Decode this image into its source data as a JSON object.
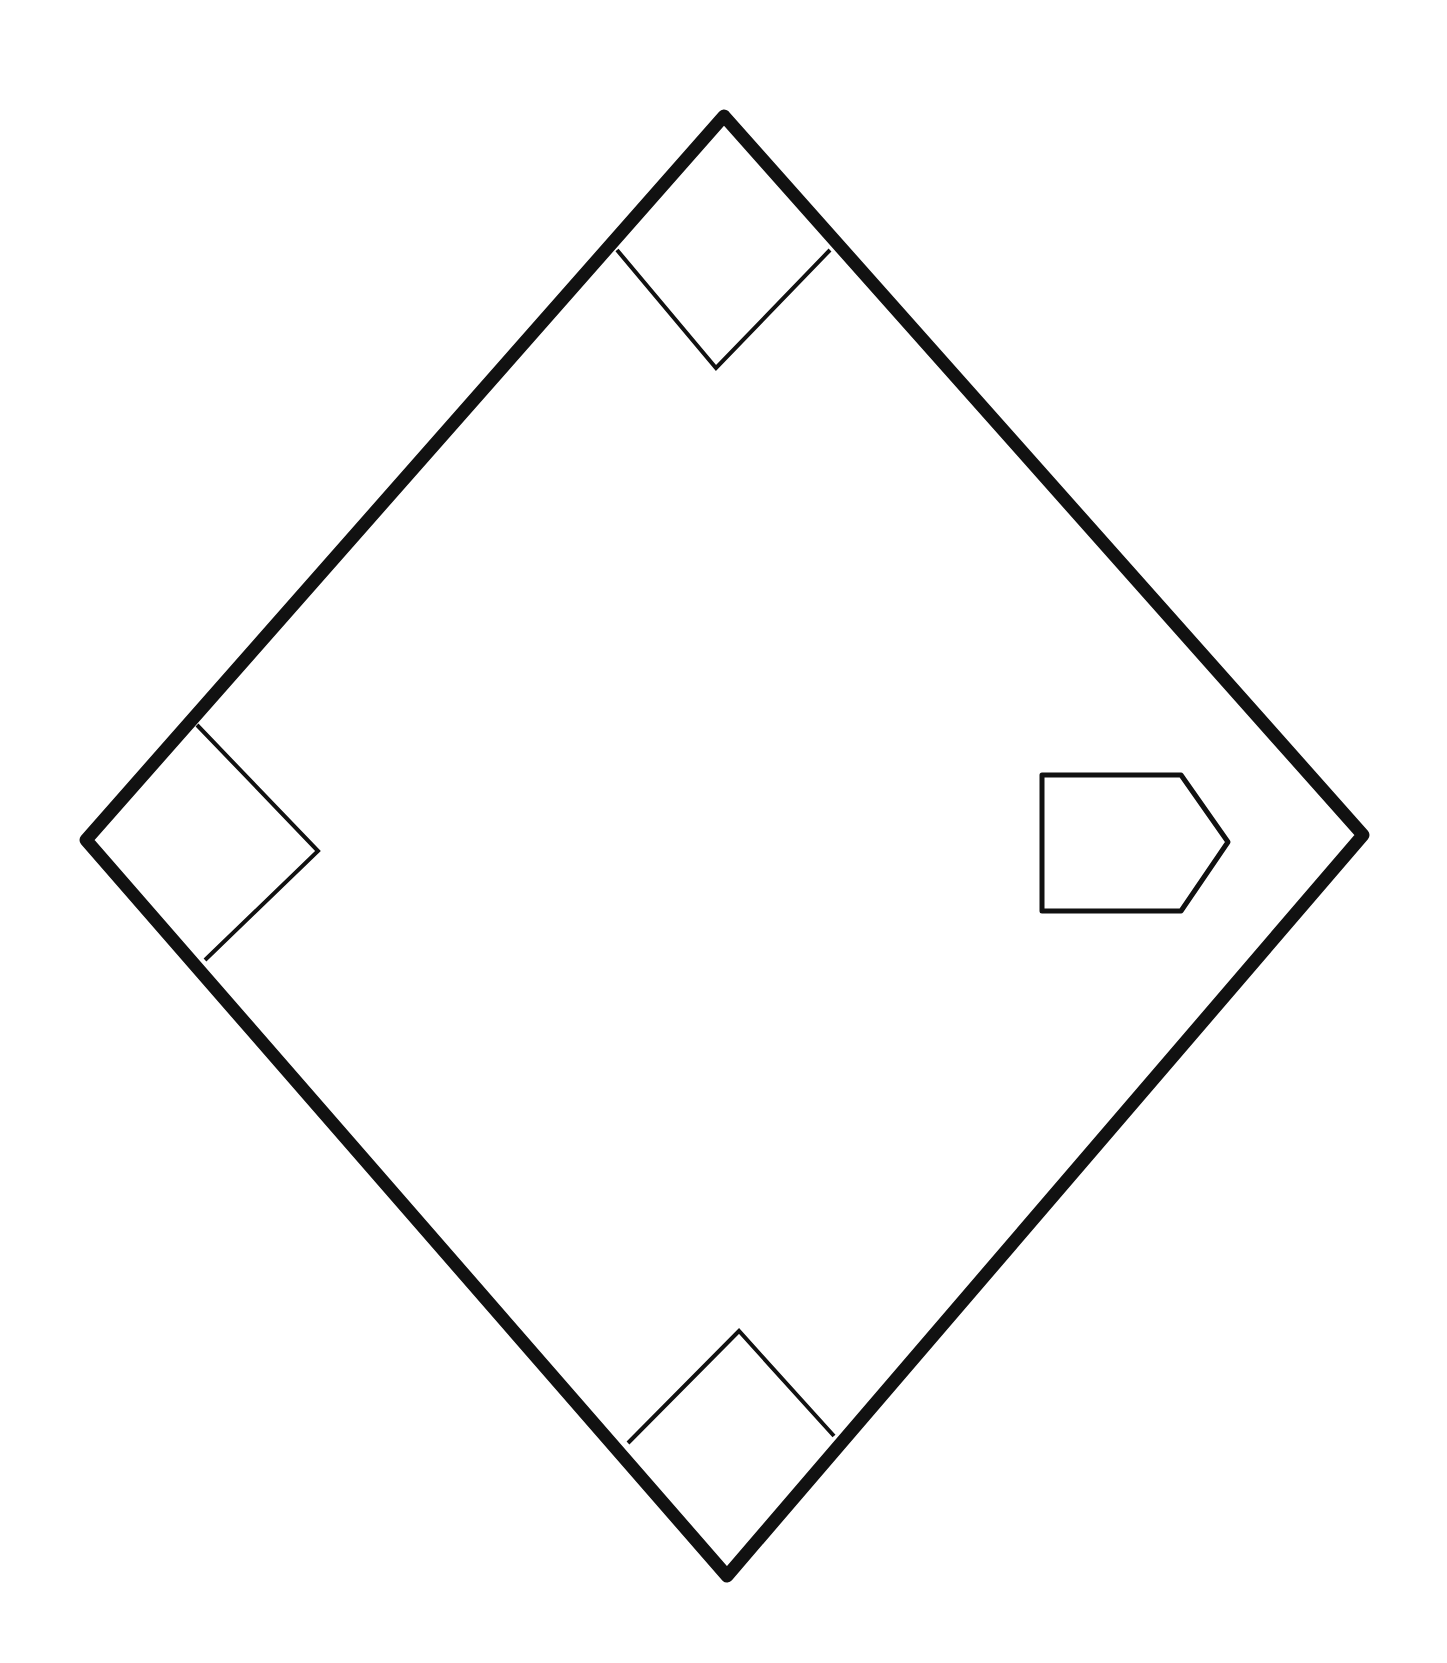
{
  "diagram": {
    "title": "",
    "type": "baseball-diamond",
    "colors": {
      "stroke": "#111111",
      "background": "#ffffff"
    },
    "field": {
      "vertices": {
        "top": [
          724,
          116
        ],
        "right": [
          1363,
          835
        ],
        "bottom": [
          727,
          1576
        ],
        "left": [
          86,
          840
        ]
      }
    },
    "bases": [
      {
        "name": "second-base",
        "points": "617,250 830,250 716,368"
      },
      {
        "name": "third-base",
        "points": "197,725 318,851 205,960"
      },
      {
        "name": "first-base",
        "points": "628,1443 739,1331 834,1436"
      },
      {
        "name": "home-plate",
        "points": "1042,775 1181,775 1228,842 1181,911 1042,911"
      }
    ]
  }
}
